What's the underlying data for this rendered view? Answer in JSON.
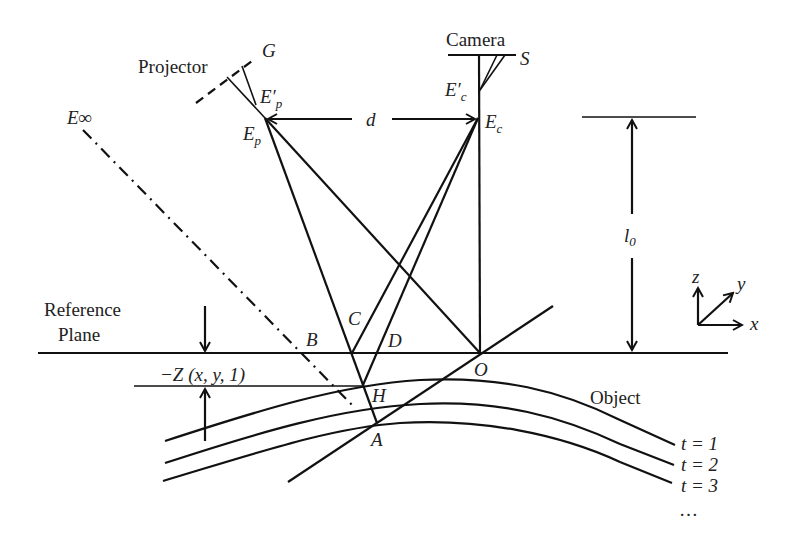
{
  "figure": {
    "type": "structured-light geometry diagram",
    "labels": {
      "projector": "Projector",
      "camera": "Camera",
      "reference_plane_line1": "Reference",
      "reference_plane_line2": "Plane",
      "object": "Object",
      "g": "G",
      "s": "S",
      "e_inf": "E∞",
      "ep_prime_base": "E′",
      "ep_prime_sub": "p",
      "ep_base": "E",
      "ep_sub": "p",
      "ec_prime_base": "E′",
      "ec_prime_sub": "c",
      "ec_base": "E",
      "ec_sub": "c",
      "d": "d",
      "l0_base": "l",
      "l0_sub": "0",
      "point_b": "B",
      "point_c": "C",
      "point_d": "D",
      "point_o": "O",
      "point_h": "H",
      "point_a": "A",
      "depth": "−Z (x, y, 1)",
      "axis_x": "x",
      "axis_y": "y",
      "axis_z": "z"
    },
    "time_steps": [
      "t = 1",
      "t = 2",
      "t = 3",
      "…"
    ]
  }
}
